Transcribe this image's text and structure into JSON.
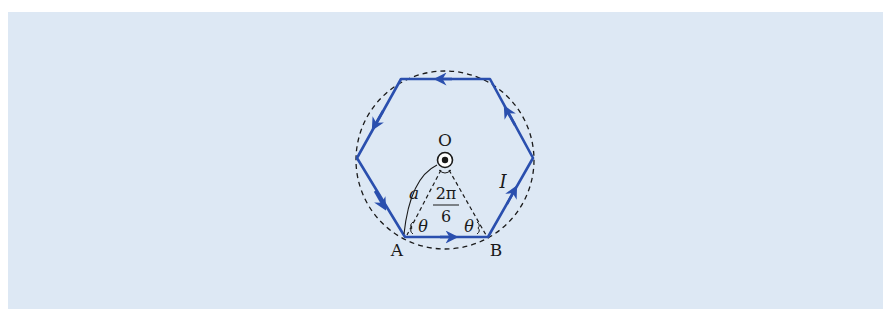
{
  "diagram": {
    "colors": {
      "background": "#dde8f4",
      "loop": "#2a4fae",
      "construction": "#1a1a1a"
    },
    "labels": {
      "center": "O",
      "vertex_a": "A",
      "vertex_b": "B",
      "current": "I",
      "radius": "a",
      "angle_left": "θ",
      "angle_right": "θ",
      "center_angle_num": "2π",
      "center_angle_den": "6"
    },
    "elements": {
      "loop_shape": "regular hexagon",
      "circumcircle": "dashed circle",
      "center_symbol": "current out of page (dot in circle)",
      "current_direction": "counter-clockwise (A→B)"
    }
  }
}
